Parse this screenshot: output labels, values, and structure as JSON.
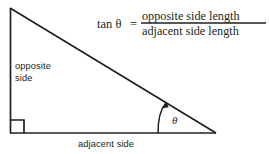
{
  "figure": {
    "kind": "right-triangle-tangent-diagram",
    "background_color": "#ffffff",
    "stroke_color": "#231f20",
    "formula": {
      "left_side": "tan θ",
      "equals": "=",
      "numerator": "opposite side length",
      "denominator": "adjacent side length"
    },
    "labels": {
      "opposite_line1": "opposite",
      "opposite_line2": "side",
      "adjacent": "adjacent side",
      "angle": "θ"
    },
    "geometry": {
      "apex": [
        10,
        8
      ],
      "right_angle_vertex": [
        10,
        133
      ],
      "angle_vertex": [
        215,
        133
      ],
      "right_angle_marker_size": 13,
      "arc_label_position": [
        175,
        119
      ]
    }
  }
}
